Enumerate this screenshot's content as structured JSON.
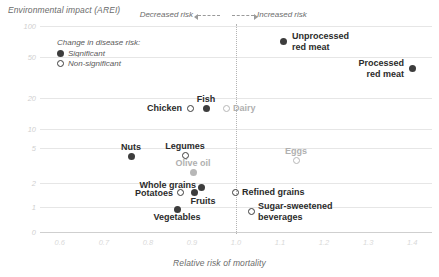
{
  "chart_data": {
    "type": "scatter",
    "title": "",
    "ylabel": "Environmental impact (AREI)",
    "xlabel": "Relative risk of mortality",
    "yscale": "log",
    "xlim": [
      0.555,
      1.445
    ],
    "ylim": [
      0.78,
      115
    ],
    "yticks": [
      "100",
      "50",
      "20",
      "10",
      "5",
      "2",
      "1",
      "0"
    ],
    "ytick_values": [
      100,
      50,
      20,
      10,
      5,
      2,
      1,
      0
    ],
    "xticks": [
      "0.6",
      "0.7",
      "0.8",
      "0.9",
      "1.0",
      "1.1",
      "1.2",
      "1.3",
      "1.4"
    ],
    "xtick_values": [
      0.6,
      0.7,
      0.8,
      0.9,
      1.0,
      1.1,
      1.2,
      1.3,
      1.4
    ],
    "grid": "horizontal",
    "reference_line_x": 1.0,
    "legend": {
      "title": "Change in disease risk:",
      "entries": [
        {
          "label": "Significant",
          "marker": "filled"
        },
        {
          "label": "Non-significant",
          "marker": "open"
        }
      ]
    },
    "annotations": [
      {
        "name": "decreased-risk",
        "text": "Decreased risk",
        "direction": "left"
      },
      {
        "name": "increased-risk",
        "text": "Increased risk",
        "direction": "right"
      }
    ],
    "points": [
      {
        "name": "unprocessed-red-meat",
        "label": "Unprocessed\nred meat",
        "x": 1.13,
        "y": 62,
        "significance": "Significant",
        "marker": "filled",
        "dim": false,
        "label_pos": "right",
        "px": 283,
        "py": 41,
        "lx": 292,
        "ly": 41
      },
      {
        "name": "processed-red-meat",
        "label": "Processed\nred meat",
        "x": 1.41,
        "y": 38,
        "significance": "Significant",
        "marker": "filled",
        "dim": false,
        "label_pos": "left",
        "px": 412,
        "py": 68,
        "lx": 404,
        "ly": 68
      },
      {
        "name": "chicken",
        "label": "Chicken",
        "x": 0.92,
        "y": 14,
        "significance": "Non-significant",
        "marker": "open",
        "dim": false,
        "label_pos": "left",
        "px": 190,
        "py": 108,
        "lx": 182,
        "ly": 108
      },
      {
        "name": "fish",
        "label": "Fish",
        "x": 0.955,
        "y": 14,
        "significance": "Significant",
        "marker": "filled",
        "dim": false,
        "label_pos": "above",
        "px": 206,
        "py": 108,
        "lx": 206,
        "ly": 104
      },
      {
        "name": "dairy",
        "label": "Dairy",
        "x": 1.0,
        "y": 14,
        "significance": "Non-significant",
        "marker": "open",
        "dim": true,
        "label_pos": "right",
        "px": 226,
        "py": 108,
        "lx": 233,
        "ly": 108
      },
      {
        "name": "nuts",
        "label": "Nuts",
        "x": 0.765,
        "y": 4.4,
        "significance": "Significant",
        "marker": "filled",
        "dim": false,
        "label_pos": "above",
        "px": 131,
        "py": 156,
        "lx": 131,
        "ly": 152
      },
      {
        "name": "legumes",
        "label": "Legumes",
        "x": 0.882,
        "y": 4.5,
        "significance": "Non-significant",
        "marker": "open",
        "dim": false,
        "label_pos": "above",
        "px": 185,
        "py": 155,
        "lx": 185,
        "ly": 151
      },
      {
        "name": "olive-oil",
        "label": "Olive oil",
        "x": 0.9,
        "y": 3.0,
        "significance": "Significant",
        "marker": "filled",
        "dim": true,
        "label_pos": "above",
        "px": 193,
        "py": 172,
        "lx": 193,
        "ly": 168
      },
      {
        "name": "eggs",
        "label": "Eggs",
        "x": 1.135,
        "y": 3.8,
        "significance": "Non-significant",
        "marker": "open",
        "dim": true,
        "label_pos": "above",
        "px": 296,
        "py": 160,
        "lx": 296,
        "ly": 156
      },
      {
        "name": "whole-grains",
        "label": "Whole grains",
        "x": 0.935,
        "y": 1.75,
        "significance": "Significant",
        "marker": "filled",
        "dim": false,
        "label_pos": "left",
        "px": 201,
        "py": 187,
        "lx": 196,
        "ly": 185
      },
      {
        "name": "potatoes",
        "label": "Potatoes",
        "x": 0.872,
        "y": 1.55,
        "significance": "Non-significant",
        "marker": "open",
        "dim": false,
        "label_pos": "left",
        "px": 180,
        "py": 192,
        "lx": 173,
        "ly": 193
      },
      {
        "name": "fruits",
        "label": "Fruits",
        "x": 0.903,
        "y": 1.55,
        "significance": "Significant",
        "marker": "filled",
        "dim": false,
        "label_pos": "below",
        "px": 194,
        "py": 192,
        "lx": 203,
        "ly": 196
      },
      {
        "name": "refined-grains",
        "label": "Refined grains",
        "x": 1.02,
        "y": 1.55,
        "significance": "Non-significant",
        "marker": "open",
        "dim": false,
        "label_pos": "right",
        "px": 235,
        "py": 192,
        "lx": 242,
        "ly": 192
      },
      {
        "name": "vegetables",
        "label": "Vegetables",
        "x": 0.865,
        "y": 1.1,
        "significance": "Significant",
        "marker": "filled",
        "dim": false,
        "label_pos": "below",
        "px": 177,
        "py": 209,
        "lx": 177,
        "ly": 212
      },
      {
        "name": "sugar-sweetened-beverages",
        "label": "Sugar-sweetened\nbeverages",
        "x": 1.035,
        "y": 1.05,
        "significance": "Non-significant",
        "marker": "open",
        "dim": false,
        "label_pos": "right",
        "px": 251,
        "py": 211,
        "lx": 258,
        "ly": 211
      }
    ]
  }
}
